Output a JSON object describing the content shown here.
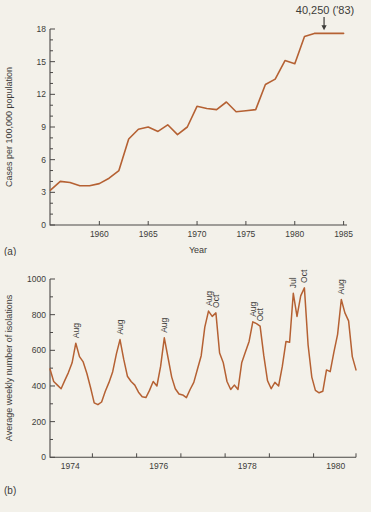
{
  "page": {
    "background_color": "#f3f1ea",
    "text_color": "#3d3c39",
    "axis_color": "#4a4846",
    "panel_a_label": "(a)",
    "panel_b_label": "(b)"
  },
  "chart_data": [
    {
      "type": "line",
      "panel": "a",
      "xlabel": "Year",
      "ylabel": "Cases per 100,000 population",
      "line_color": "#b56133",
      "x_start_year": 1955,
      "x_step_years": 1,
      "values": [
        3.2,
        4.0,
        3.9,
        3.6,
        3.6,
        3.8,
        4.3,
        5.0,
        7.9,
        8.8,
        9.0,
        8.6,
        9.2,
        8.3,
        9.0,
        10.9,
        10.7,
        10.6,
        11.3,
        10.4,
        10.5,
        10.6,
        12.9,
        13.4,
        15.1,
        14.8,
        17.3,
        17.6,
        17.6,
        17.6,
        17.6
      ],
      "xlim": [
        1955,
        1985
      ],
      "ylim": [
        0,
        18
      ],
      "x_ticks": [
        1960,
        1965,
        1970,
        1975,
        1980,
        1985
      ],
      "y_ticks_major": [
        0,
        3,
        6,
        9,
        12,
        15,
        18
      ],
      "y_minor_step": 1,
      "grid": "off",
      "annotation": {
        "text": "40,250 ('83)",
        "arrow_target_year": 1983,
        "arrow_target_value": 17.6
      }
    },
    {
      "type": "line",
      "panel": "b",
      "xlabel": "",
      "ylabel": "Average weekly number of isolations",
      "line_color": "#b56133",
      "x_start": "1974-01",
      "points_per_year": 12,
      "monthly_values": [
        495,
        425,
        405,
        385,
        430,
        475,
        530,
        640,
        565,
        535,
        470,
        390,
        305,
        295,
        310,
        370,
        420,
        480,
        580,
        660,
        550,
        455,
        425,
        405,
        365,
        340,
        335,
        375,
        425,
        400,
        510,
        670,
        560,
        450,
        385,
        355,
        350,
        335,
        380,
        420,
        495,
        570,
        730,
        820,
        790,
        810,
        585,
        530,
        425,
        380,
        405,
        380,
        530,
        590,
        650,
        760,
        750,
        735,
        570,
        430,
        385,
        420,
        400,
        510,
        650,
        645,
        920,
        790,
        905,
        950,
        630,
        450,
        375,
        362,
        370,
        490,
        480,
        590,
        690,
        885,
        810,
        765,
        565,
        490
      ],
      "xlim": [
        "1974-01",
        "1980-12"
      ],
      "ylim": [
        0,
        1000
      ],
      "x_year_labels": [
        1974,
        1976,
        1978,
        1980
      ],
      "x_tick_year_boundaries": [
        1975,
        1976,
        1977,
        1978,
        1979,
        1980,
        1981
      ],
      "y_ticks_major": [
        0,
        200,
        400,
        600,
        800,
        1000
      ],
      "y_minor_step": 100,
      "grid": "off",
      "peak_labels": [
        {
          "label": "Aug",
          "month_index": 7
        },
        {
          "label": "Aug",
          "month_index": 19
        },
        {
          "label": "Aug",
          "month_index": 31
        },
        {
          "label": "Aug",
          "month_index": 43
        },
        {
          "label": "Oct",
          "month_index": 45
        },
        {
          "label": "Aug",
          "month_index": 55
        },
        {
          "label": "Oct",
          "month_index": 57
        },
        {
          "label": "Jul",
          "month_index": 66
        },
        {
          "label": "Oct",
          "month_index": 69
        },
        {
          "label": "Aug",
          "month_index": 79
        }
      ]
    }
  ]
}
